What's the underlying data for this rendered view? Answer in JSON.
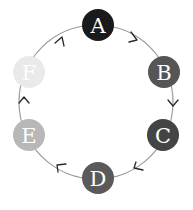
{
  "diagram": {
    "type": "cycle",
    "direction": "clockwise",
    "ring": {
      "cx": 96,
      "cy": 102,
      "r": 77,
      "color": "#9a9a9a"
    },
    "node_radius": 16,
    "nodes": [
      {
        "id": "A",
        "label": "A",
        "cx": 98,
        "cy": 25,
        "color": "#1a1a1a"
      },
      {
        "id": "B",
        "label": "B",
        "cx": 164,
        "cy": 72,
        "color": "#555555"
      },
      {
        "id": "C",
        "label": "C",
        "cx": 163,
        "cy": 135,
        "color": "#444444"
      },
      {
        "id": "D",
        "label": "D",
        "cx": 98,
        "cy": 178,
        "color": "#5a5a5a"
      },
      {
        "id": "E",
        "label": "E",
        "cx": 29,
        "cy": 135,
        "color": "#b8b8b8"
      },
      {
        "id": "F",
        "label": "F",
        "cx": 29,
        "cy": 72,
        "color": "#eaeaea"
      }
    ],
    "edges": [
      {
        "from": "A",
        "to": "B"
      },
      {
        "from": "B",
        "to": "C"
      },
      {
        "from": "C",
        "to": "D"
      },
      {
        "from": "D",
        "to": "E"
      },
      {
        "from": "E",
        "to": "F"
      },
      {
        "from": "F",
        "to": "A"
      }
    ]
  }
}
